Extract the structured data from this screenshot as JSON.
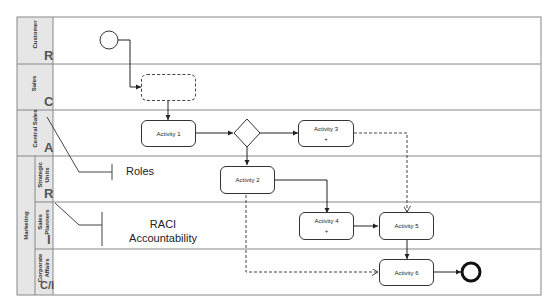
{
  "lanes": [
    {
      "name": "Customer",
      "raci": "R"
    },
    {
      "name": "Sales",
      "raci": "C"
    },
    {
      "name": "Central Sales",
      "raci": "A"
    },
    {
      "name": "Strategic Units",
      "raci": "R"
    },
    {
      "name": "Sales Planners",
      "raci": "I"
    },
    {
      "name": "Corporate Affairs",
      "raci": "C/I"
    }
  ],
  "group": {
    "name": "Marketing"
  },
  "activities": {
    "a1": "Activity 1",
    "a2": "Activity 2",
    "a3": "Activity 3",
    "a4": "Activity 4",
    "a5": "Activity 5",
    "a6": "Activity 6",
    "subprocess_marker": "+"
  },
  "annotations": {
    "roles": "Roles",
    "raci_line1": "RACI",
    "raci_line2": "Accountability"
  },
  "colors": {
    "lane_header_bg": "#e6e6e6",
    "border": "#888888",
    "stroke": "#333333"
  }
}
